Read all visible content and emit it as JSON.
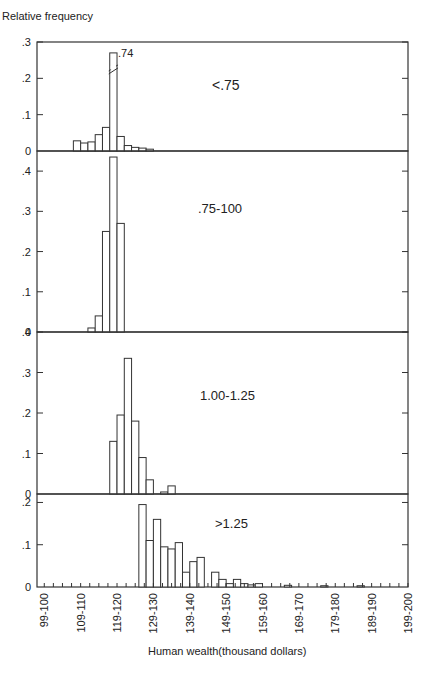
{
  "chart_data": {
    "type": "bar",
    "title": "",
    "ylabel": "Relative frequency",
    "xlabel": "Human wealth(thousand dollars)",
    "x_tick_labels": [
      "99-100",
      "109-110",
      "119-120",
      "129-130",
      "139-140",
      "149-150",
      "159-160",
      "169-170",
      "179-180",
      "189-190",
      "199-200"
    ],
    "x_range": [
      98,
      200
    ],
    "bin_width": 2,
    "panels": [
      {
        "label": "<.75",
        "ylim": [
          0,
          0.3
        ],
        "yticks": [
          "0",
          ".1",
          ".2",
          ".3"
        ],
        "yticks_values": [
          0,
          0.1,
          0.2,
          0.3
        ],
        "annotation": ".74",
        "broken_bar_note": "bar at 120-122 truncated, true value .74",
        "bins_start": [
          108,
          110,
          112,
          114,
          116,
          118,
          120,
          122,
          124,
          126,
          128,
          130
        ],
        "values": [
          0.028,
          0.022,
          0.025,
          0.045,
          0.065,
          0.74,
          0.04,
          0.015,
          0.01,
          0.008,
          0.005,
          0.0
        ]
      },
      {
        "label": ".75-100",
        "ylim": [
          0,
          0.45
        ],
        "yticks": [
          "0",
          ".1",
          ".2",
          ".3",
          ".4"
        ],
        "yticks_values": [
          0,
          0.1,
          0.2,
          0.3,
          0.4
        ],
        "bins_start": [
          112,
          114,
          116,
          118,
          120
        ],
        "values": [
          0.01,
          0.04,
          0.25,
          0.435,
          0.27
        ]
      },
      {
        "label": "1.00-1.25",
        "ylim": [
          0,
          0.4
        ],
        "yticks": [
          "0",
          ".1",
          ".2",
          ".3",
          ".4"
        ],
        "yticks_values": [
          0,
          0.1,
          0.2,
          0.3,
          0.4
        ],
        "bins_start": [
          118,
          120,
          122,
          124,
          126,
          128,
          130,
          132,
          134
        ],
        "values": [
          0.13,
          0.195,
          0.335,
          0.18,
          0.09,
          0.035,
          0.0,
          0.005,
          0.02
        ]
      },
      {
        "label": ">1.25",
        "ylim": [
          0,
          0.22
        ],
        "yticks": [
          "0",
          ".1",
          ".2"
        ],
        "yticks_values": [
          0,
          0.1,
          0.2
        ],
        "bins_start": [
          126,
          128,
          130,
          132,
          134,
          136,
          138,
          140,
          142,
          144,
          146,
          148,
          150,
          152,
          154,
          156,
          158,
          166,
          176,
          186
        ],
        "values": [
          0.195,
          0.11,
          0.16,
          0.095,
          0.09,
          0.105,
          0.035,
          0.06,
          0.07,
          0.0,
          0.035,
          0.018,
          0.008,
          0.018,
          0.008,
          0.005,
          0.008,
          0.004,
          0.003,
          0.003
        ]
      }
    ],
    "grid": false,
    "legend": null
  }
}
